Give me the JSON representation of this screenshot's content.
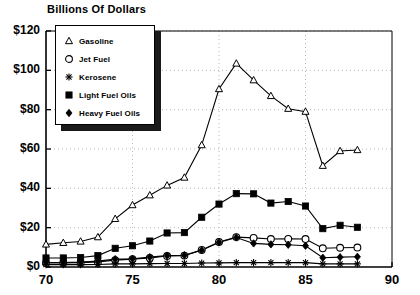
{
  "chart_data": {
    "type": "line",
    "title": "Billions Of Dollars",
    "xlabel": "",
    "ylabel": "",
    "xlim": [
      70,
      90
    ],
    "ylim": [
      0,
      120
    ],
    "x_tick_labels": [
      "70",
      "75",
      "80",
      "85",
      "90"
    ],
    "x_ticks": [
      70,
      75,
      80,
      85,
      90
    ],
    "y_tick_labels": [
      "$0",
      "$20",
      "$40",
      "$60",
      "$80",
      "$100",
      "$120"
    ],
    "y_ticks": [
      0,
      20,
      40,
      60,
      80,
      100,
      120
    ],
    "grid": true,
    "legend_position": "top-left",
    "x": [
      70,
      71,
      72,
      73,
      74,
      75,
      76,
      77,
      78,
      79,
      80,
      81,
      82,
      83,
      84,
      85,
      86,
      87,
      88
    ],
    "series": [
      {
        "name": "Gasoline",
        "marker": "triangle-open",
        "values": [
          11.5,
          12.3,
          13.0,
          15.2,
          24.5,
          31.5,
          36.5,
          41.5,
          45.5,
          62.0,
          90.5,
          103.5,
          95.0,
          87.0,
          80.5,
          79.0,
          51.5,
          59.0,
          59.5
        ]
      },
      {
        "name": "Jet Fuel",
        "marker": "circle-open",
        "values": [
          2.0,
          2.1,
          2.2,
          2.6,
          3.5,
          4.0,
          4.6,
          5.6,
          5.8,
          8.7,
          12.7,
          15.2,
          14.8,
          14.2,
          14.3,
          14.2,
          9.5,
          9.8,
          9.9
        ]
      },
      {
        "name": "Kerosene",
        "marker": "asterisk",
        "values": [
          1.2,
          1.2,
          1.2,
          1.3,
          1.6,
          1.6,
          1.7,
          1.8,
          1.8,
          2.0,
          2.1,
          2.2,
          2.2,
          2.2,
          2.2,
          2.2,
          1.6,
          1.6,
          1.6
        ]
      },
      {
        "name": "Light Fuel Oils",
        "marker": "square-filled",
        "values": [
          4.6,
          4.6,
          4.8,
          5.8,
          9.5,
          10.8,
          13.2,
          17.3,
          17.5,
          25.3,
          32.0,
          37.3,
          37.2,
          32.5,
          33.3,
          31.0,
          19.5,
          21.2,
          20.2
        ]
      },
      {
        "name": "Heavy Fuel Oils",
        "marker": "diamond-filled",
        "values": [
          2.3,
          2.3,
          2.5,
          3.0,
          4.0,
          4.2,
          5.0,
          5.8,
          6.0,
          8.5,
          12.5,
          15.0,
          12.0,
          11.5,
          11.3,
          10.8,
          4.7,
          5.0,
          5.2
        ]
      }
    ]
  },
  "legend": {
    "items": [
      {
        "label": "Gasoline",
        "marker": "triangle-open-icon"
      },
      {
        "label": "Jet Fuel",
        "marker": "circle-open-icon"
      },
      {
        "label": "Kerosene",
        "marker": "asterisk-icon"
      },
      {
        "label": "Light Fuel Oils",
        "marker": "square-filled-icon"
      },
      {
        "label": "Heavy Fuel Oils",
        "marker": "diamond-filled-icon"
      }
    ]
  },
  "colors": {
    "line": "#000000",
    "marker_fill_open": "#ffffff",
    "marker_fill_solid": "#000000",
    "grid": "#b8b8b8",
    "axis": "#000000",
    "background": "#ffffff",
    "legend_shadow": "#1a1a1a"
  }
}
